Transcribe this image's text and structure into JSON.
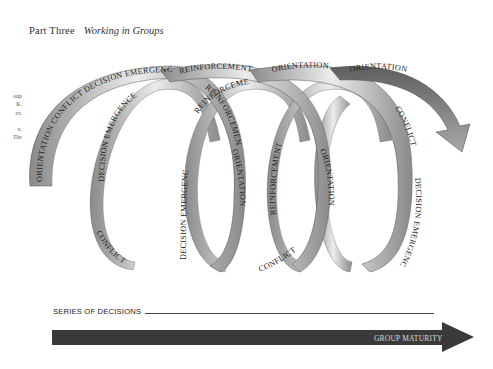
{
  "header": {
    "part": "Part Three",
    "title": "Working in Groups"
  },
  "margin_note": {
    "lines": [
      "oup",
      "K.",
      "es.",
      "",
      "e.",
      "The"
    ]
  },
  "diagram": {
    "type": "spiral-phase-model",
    "loops": 4,
    "ribbon_gradient": [
      "#6a6a6a",
      "#d8d8d8",
      "#f4f4f4"
    ],
    "labels": {
      "loop1_outer": [
        "ORIENTATION",
        "CONFLICT",
        "DECISION EMERGENCE"
      ],
      "loop1_inner_left": "DECISION EMERGENCE",
      "loop1_bottom": "CONFLICT",
      "top_reinforcement_1": "REINFORCEMENT",
      "reinforcement_2": "REINFORCEMENT",
      "reinforcement_3": "REINFORCEMENT",
      "loop2_left": "DECISION EMERGENCE",
      "loop2_right": "ORIENTATION",
      "top_orientation_1": "ORIENTATION",
      "loop3_left": "REINFORCEMENT",
      "loop3_right": "ORIENTATION",
      "loop3_bottom": "CONFLICT",
      "top_orientation_2": "ORIENTATION",
      "loop4_conflict": "CONFLICT",
      "loop4_right": "DECISION EMERGENCE"
    }
  },
  "footer": {
    "series_label": "SERIES OF DECISIONS",
    "maturity_label": "GROUP MATURITY",
    "arrow_color": "#3a3a3a"
  }
}
